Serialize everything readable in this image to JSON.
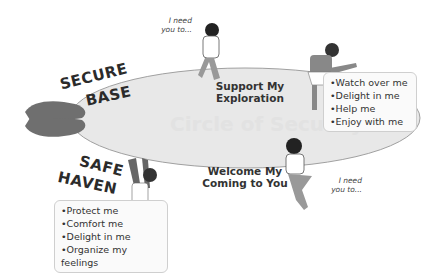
{
  "diagram": {
    "watermark": "Circle of Security",
    "top_label": "Support My Exploration",
    "top_label_lines": [
      "Support My",
      "Exploration"
    ],
    "bottom_label_lines": [
      "Welcome My",
      "Coming to You"
    ],
    "secure_base": [
      "SECURE",
      "BASE"
    ],
    "safe_haven": [
      "SAFE",
      "HAVEN"
    ],
    "i_need_top": [
      "I need",
      "you to..."
    ],
    "i_need_bottom": [
      "I need",
      "you to..."
    ],
    "exploration_needs": [
      "Watch over me",
      "Delight in me",
      "Help me",
      "Enjoy with me"
    ],
    "haven_needs": [
      "Protect me",
      "Comfort me",
      "Delight in me",
      "Organize my feelings"
    ],
    "colors": {
      "ellipse_fill": "#e6e6e6",
      "ellipse_stroke": "#9a9a9a",
      "hands": "#6e6e6e",
      "text": "#2b2b2b"
    }
  }
}
